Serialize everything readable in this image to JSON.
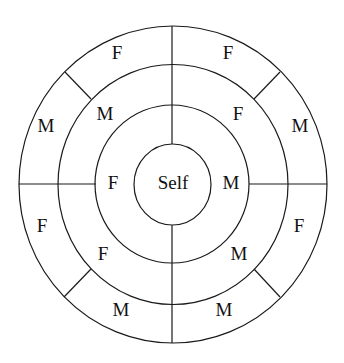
{
  "diagram": {
    "type": "concentric-kinship-circle",
    "center_label": "Self",
    "inner_ring": [
      {
        "position": "left",
        "label": "F"
      },
      {
        "position": "right",
        "label": "M"
      }
    ],
    "middle_ring": [
      {
        "position": "upper-left",
        "label": "M"
      },
      {
        "position": "upper-right",
        "label": "F"
      },
      {
        "position": "lower-left",
        "label": "F"
      },
      {
        "position": "lower-right",
        "label": "M"
      }
    ],
    "outer_ring": [
      {
        "position": "top-left",
        "label": "F"
      },
      {
        "position": "top-right",
        "label": "F"
      },
      {
        "position": "left-upper",
        "label": "M"
      },
      {
        "position": "right-upper",
        "label": "M"
      },
      {
        "position": "left-lower",
        "label": "F"
      },
      {
        "position": "right-lower",
        "label": "F"
      },
      {
        "position": "bottom-left",
        "label": "M"
      },
      {
        "position": "bottom-right",
        "label": "M"
      }
    ]
  }
}
